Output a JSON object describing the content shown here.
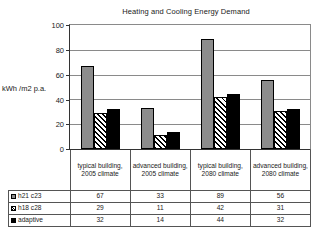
{
  "chart_data": {
    "type": "bar",
    "title": "Heating and Cooling Energy Demand",
    "xlabel": "",
    "ylabel": "kWh /m2 p.a.",
    "ylim": [
      0,
      100
    ],
    "yticks": [
      0,
      20,
      40,
      60,
      80,
      100
    ],
    "grid": true,
    "legend_position": "table-below",
    "categories": [
      "typical building, 2005 climate",
      "advanced building, 2005 climate",
      "typical building, 2080 climate",
      "advanced building, 2080 climate"
    ],
    "series": [
      {
        "name": "h21 c23",
        "values": [
          67,
          33,
          89,
          56
        ],
        "swatch": "gray-solid",
        "color": "#8c8c8c"
      },
      {
        "name": "h18 c28",
        "values": [
          29,
          11,
          42,
          31
        ],
        "swatch": "diagonal-hatch",
        "color": "#ffffff"
      },
      {
        "name": "adaptive",
        "values": [
          32,
          14,
          44,
          32
        ],
        "swatch": "black-solid",
        "color": "#000000"
      }
    ]
  },
  "table": {
    "header_row": [
      "typical building, 2005 climate",
      "advanced building, 2005 climate",
      "typical building, 2080 climate",
      "advanced building, 2080 climate"
    ],
    "rows": [
      {
        "label": "h21 c23",
        "values": [
          "67",
          "33",
          "89",
          "56"
        ]
      },
      {
        "label": "h18 c28",
        "values": [
          "29",
          "11",
          "42",
          "31"
        ]
      },
      {
        "label": "adaptive",
        "values": [
          "32",
          "14",
          "44",
          "32"
        ]
      }
    ]
  },
  "axis": {
    "y_tick_labels": [
      "100",
      "80",
      "60",
      "40",
      "20",
      "0"
    ]
  }
}
